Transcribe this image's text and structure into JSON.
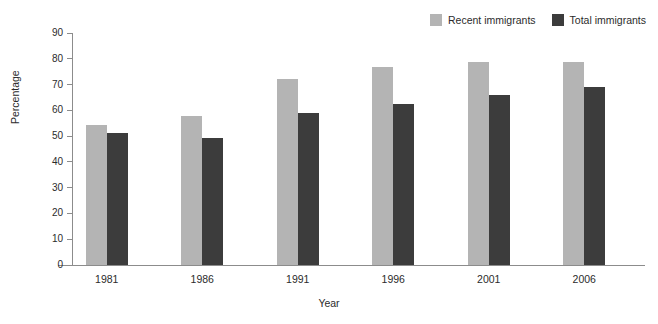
{
  "chart_data": {
    "type": "bar",
    "title": "",
    "xlabel": "Year",
    "ylabel": "Percentage",
    "categories": [
      "1981",
      "1986",
      "1991",
      "1996",
      "2001",
      "2006"
    ],
    "series": [
      {
        "name": "Recent immigrants",
        "color": "#b4b4b4",
        "values": [
          54.5,
          58,
          72,
          77,
          78.7,
          78.8
        ]
      },
      {
        "name": "Total immigrants",
        "color": "#3c3c3c",
        "values": [
          51.4,
          49.2,
          59,
          62.5,
          65.8,
          69.1
        ]
      }
    ],
    "ylim": [
      0,
      90
    ],
    "yticks": [
      0,
      10,
      20,
      30,
      40,
      50,
      60,
      70,
      80,
      90
    ],
    "grid": false,
    "legend_position": "top-right"
  },
  "axis": {
    "y_title": "Percentage",
    "x_title": "Year"
  }
}
